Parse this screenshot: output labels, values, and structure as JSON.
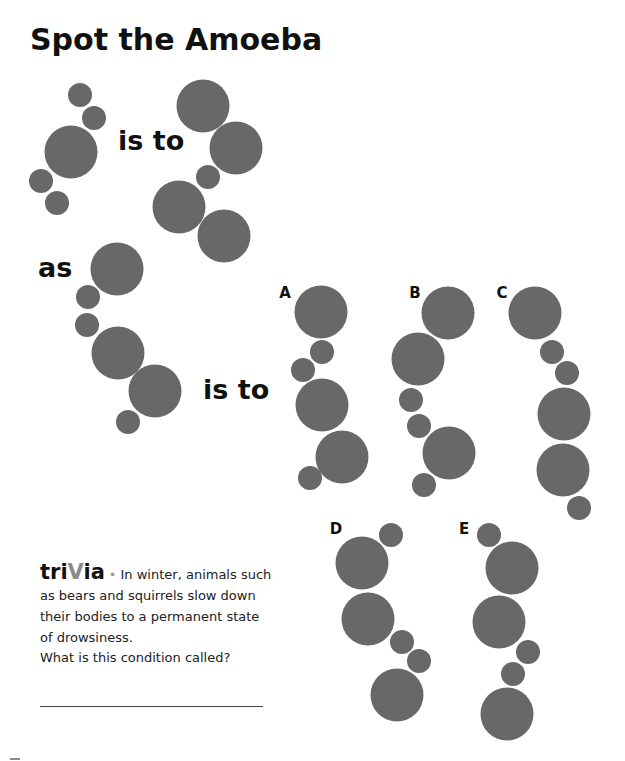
{
  "title": "Spot the Amoeba",
  "words": {
    "is_to_1": "is to",
    "as": "as",
    "is_to_2": "is to"
  },
  "circle_color": "#686868",
  "groups": {
    "example_a": [
      [
        "s",
        80,
        95
      ],
      [
        "s",
        94,
        118
      ],
      [
        "b",
        71,
        152
      ],
      [
        "s",
        41,
        181
      ],
      [
        "s",
        57,
        203
      ]
    ],
    "example_b": [
      [
        "b",
        203,
        106
      ],
      [
        "b",
        236,
        148
      ],
      [
        "s",
        208,
        177
      ],
      [
        "b",
        179,
        207
      ],
      [
        "b",
        224,
        236
      ]
    ],
    "prompt": [
      [
        "b",
        117,
        269
      ],
      [
        "s",
        88,
        297
      ],
      [
        "s",
        87,
        325
      ],
      [
        "b",
        118,
        353
      ],
      [
        "b",
        155,
        391
      ],
      [
        "s",
        128,
        422
      ]
    ],
    "A": [
      [
        "b",
        321,
        312
      ],
      [
        "s",
        322,
        352
      ],
      [
        "s",
        303,
        370
      ],
      [
        "b",
        322,
        405
      ],
      [
        "b",
        342,
        457
      ],
      [
        "s",
        310,
        478
      ]
    ],
    "B": [
      [
        "b",
        448,
        313
      ],
      [
        "b",
        418,
        359
      ],
      [
        "s",
        411,
        400
      ],
      [
        "s",
        419,
        426
      ],
      [
        "b",
        449,
        453
      ],
      [
        "s",
        424,
        485
      ]
    ],
    "C": [
      [
        "b",
        535,
        313
      ],
      [
        "s",
        552,
        352
      ],
      [
        "s",
        567,
        373
      ],
      [
        "b",
        564,
        414
      ],
      [
        "b",
        563,
        470
      ],
      [
        "s",
        579,
        508
      ]
    ],
    "D": [
      [
        "s",
        391,
        535
      ],
      [
        "b",
        362,
        563
      ],
      [
        "b",
        368,
        619
      ],
      [
        "s",
        402,
        642
      ],
      [
        "s",
        419,
        661
      ],
      [
        "b",
        397,
        695
      ]
    ],
    "E": [
      [
        "s",
        489,
        535
      ],
      [
        "b",
        512,
        568
      ],
      [
        "b",
        499,
        622
      ],
      [
        "s",
        528,
        652
      ],
      [
        "s",
        513,
        674
      ],
      [
        "b",
        507,
        714
      ]
    ]
  },
  "options": [
    {
      "label": "A",
      "x": 285,
      "y": 293
    },
    {
      "label": "B",
      "x": 415,
      "y": 293
    },
    {
      "label": "C",
      "x": 502,
      "y": 293
    },
    {
      "label": "D",
      "x": 336,
      "y": 529
    },
    {
      "label": "E",
      "x": 464,
      "y": 529
    }
  ],
  "trivia": {
    "heading_pre": "tri",
    "heading_v": "V",
    "heading_post": "ia",
    "bullet": "•",
    "text": "In winter, animals such as bears and squirrels slow down their bodies to a permanent state of drowsiness.",
    "question": "What is this condition called?",
    "answer": ""
  }
}
